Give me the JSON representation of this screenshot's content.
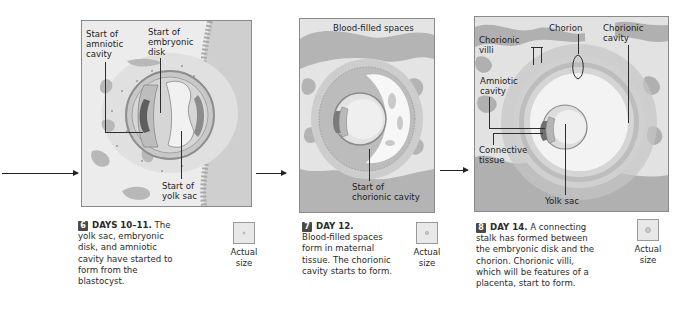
{
  "stages": [
    {
      "number": "6",
      "day": "DAYS 10–11.",
      "caption": "The yolk sac, embryonic disk, and amniotic cavity have started to form from the blastocyst.",
      "caption_lines": [
        "yolk sac, embryonic",
        "disk, and amniotic",
        "cavity have started to",
        "form from the",
        "blastocyst."
      ],
      "caption_first": "The",
      "labels": {
        "amniotic": "Start of amniotic cavity",
        "amniotic_l1": "Start of",
        "amniotic_l2": "amniotic",
        "amniotic_l3": "cavity",
        "disk_l1": "Start of",
        "disk_l2": "embryonic",
        "disk_l3": "disk",
        "yolk_l1": "Start of",
        "yolk_l2": "yolk sac"
      },
      "actual_size": [
        "Actual",
        "size"
      ]
    },
    {
      "number": "7",
      "day": "DAY 12.",
      "caption_lines": [
        "Blood-filled spaces",
        "form in maternal",
        "tissue. The chorionic",
        "cavity starts to form."
      ],
      "labels": {
        "blood": "Blood-filled spaces",
        "chorionic_l1": "Start of",
        "chorionic_l2": "chorionic cavity"
      },
      "actual_size": [
        "Actual",
        "size"
      ]
    },
    {
      "number": "8",
      "day": "DAY 14.",
      "caption_first": "A connecting",
      "caption_lines": [
        "stalk has formed between",
        "the embryonic disk and the",
        "chorion. Chorionic villi,",
        "which will be features of a",
        "placenta, start to form."
      ],
      "labels": {
        "chorion": "Chorion",
        "chorionic_cavity_l1": "Chorionic",
        "chorionic_cavity_l2": "cavity",
        "villi_l1": "Chorionic",
        "villi_l2": "villi",
        "amniotic_l1": "Amniotic",
        "amniotic_l2": "cavity",
        "connective_l1": "Connective",
        "connective_l2": "tissue",
        "yolk": "Yolk sac"
      },
      "actual_size": [
        "Actual",
        "size"
      ]
    }
  ]
}
